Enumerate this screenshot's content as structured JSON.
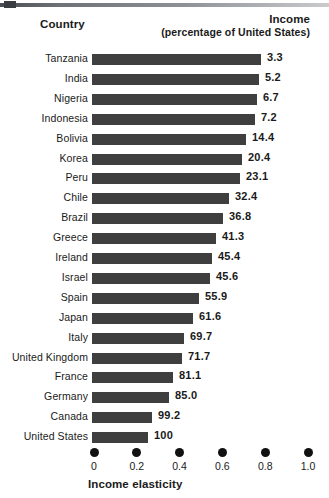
{
  "headers": {
    "country": "Country",
    "income_line1": "Income",
    "income_line2": "(percentage of United States)"
  },
  "axis": {
    "title": "Income elasticity",
    "ticks": [
      "0",
      "0.2",
      "0.4",
      "0.6",
      "0.8",
      "1.0"
    ]
  },
  "colors": {
    "bar": "#3f3f3f",
    "tick": "#111111",
    "rule": "#4a4d52",
    "text": "#1a1a1a"
  },
  "chart_data": {
    "type": "bar",
    "orientation": "horizontal",
    "title": "",
    "xlabel": "Income elasticity",
    "ylabel": "Country",
    "xlim": [
      0,
      1.0
    ],
    "xticks": [
      0,
      0.2,
      0.4,
      0.6,
      0.8,
      1.0
    ],
    "grid": false,
    "legend": null,
    "value_label_header": "Income (percentage of United States)",
    "categories": [
      "Tanzania",
      "India",
      "Nigeria",
      "Indonesia",
      "Bolivia",
      "Korea",
      "Peru",
      "Chile",
      "Brazil",
      "Greece",
      "Ireland",
      "Israel",
      "Spain",
      "Japan",
      "Italy",
      "United Kingdom",
      "France",
      "Germany",
      "Canada",
      "United States"
    ],
    "values": [
      0.79,
      0.78,
      0.77,
      0.76,
      0.72,
      0.7,
      0.69,
      0.64,
      0.61,
      0.58,
      0.56,
      0.55,
      0.5,
      0.47,
      0.43,
      0.42,
      0.38,
      0.36,
      0.28,
      0.26
    ],
    "data_labels": [
      "3.3",
      "5.2",
      "6.7",
      "7.2",
      "14.4",
      "20.4",
      "23.1",
      "32.4",
      "36.8",
      "41.3",
      "45.4",
      "45.6",
      "55.9",
      "61.6",
      "69.7",
      "71.7",
      "81.1",
      "85.0",
      "99.2",
      "100"
    ],
    "rows": [
      {
        "country": "Tanzania",
        "elasticity": 0.79,
        "income_pct": "3.3"
      },
      {
        "country": "India",
        "elasticity": 0.78,
        "income_pct": "5.2"
      },
      {
        "country": "Nigeria",
        "elasticity": 0.77,
        "income_pct": "6.7"
      },
      {
        "country": "Indonesia",
        "elasticity": 0.76,
        "income_pct": "7.2"
      },
      {
        "country": "Bolivia",
        "elasticity": 0.72,
        "income_pct": "14.4"
      },
      {
        "country": "Korea",
        "elasticity": 0.7,
        "income_pct": "20.4"
      },
      {
        "country": "Peru",
        "elasticity": 0.69,
        "income_pct": "23.1"
      },
      {
        "country": "Chile",
        "elasticity": 0.64,
        "income_pct": "32.4"
      },
      {
        "country": "Brazil",
        "elasticity": 0.61,
        "income_pct": "36.8"
      },
      {
        "country": "Greece",
        "elasticity": 0.58,
        "income_pct": "41.3"
      },
      {
        "country": "Ireland",
        "elasticity": 0.56,
        "income_pct": "45.4"
      },
      {
        "country": "Israel",
        "elasticity": 0.55,
        "income_pct": "45.6"
      },
      {
        "country": "Spain",
        "elasticity": 0.5,
        "income_pct": "55.9"
      },
      {
        "country": "Japan",
        "elasticity": 0.47,
        "income_pct": "61.6"
      },
      {
        "country": "Italy",
        "elasticity": 0.43,
        "income_pct": "69.7"
      },
      {
        "country": "United Kingdom",
        "elasticity": 0.42,
        "income_pct": "71.7"
      },
      {
        "country": "France",
        "elasticity": 0.38,
        "income_pct": "81.1"
      },
      {
        "country": "Germany",
        "elasticity": 0.36,
        "income_pct": "85.0"
      },
      {
        "country": "Canada",
        "elasticity": 0.28,
        "income_pct": "99.2"
      },
      {
        "country": "United States",
        "elasticity": 0.26,
        "income_pct": "100"
      }
    ]
  }
}
